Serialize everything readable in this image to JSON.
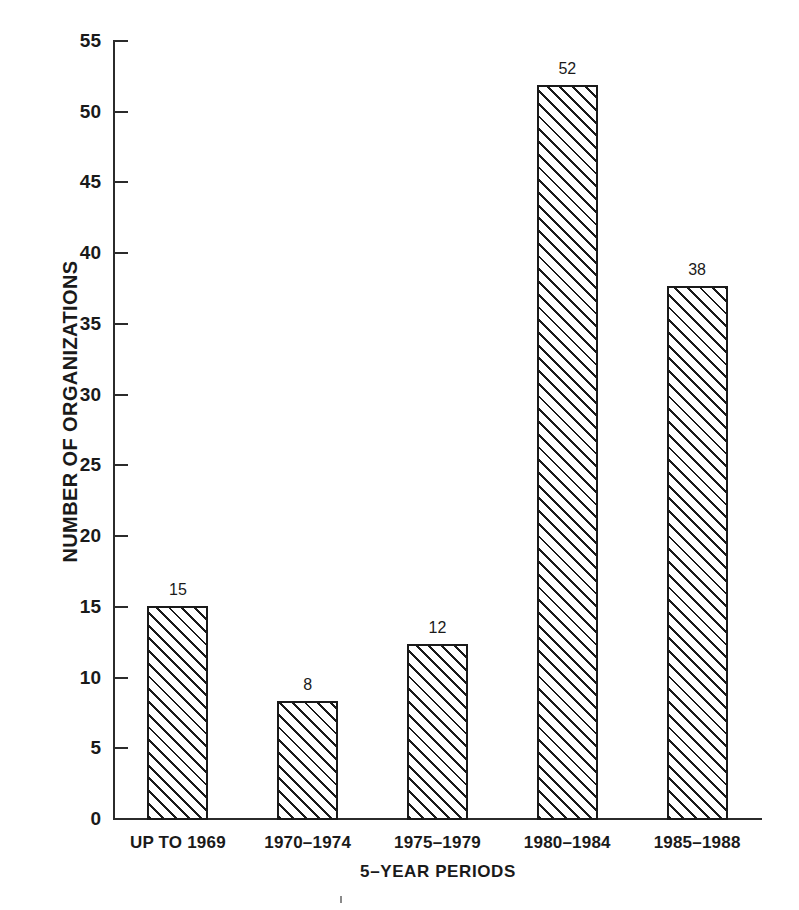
{
  "chart_data": {
    "type": "bar",
    "title": "",
    "subtitle": "",
    "xlabel": "5–YEAR PERIODS",
    "ylabel": "NUMBER OF ORGANIZATIONS",
    "categories": [
      "UP TO 1969",
      "1970–1974",
      "1975–1979",
      "1980–1984",
      "1985–1988"
    ],
    "values": [
      15,
      8,
      12,
      52,
      38
    ],
    "plotted_heights": [
      15.0,
      8.3,
      12.3,
      51.8,
      37.6
    ],
    "data_labels": [
      "15",
      "8",
      "12",
      "52",
      "38"
    ],
    "ylim": [
      0,
      55
    ],
    "ytick_step": 5,
    "yticks": [
      0,
      5,
      10,
      15,
      20,
      25,
      30,
      35,
      40,
      45,
      50,
      55
    ],
    "ytick_labels": [
      "0",
      "5",
      "10",
      "15",
      "20",
      "25",
      "30",
      "35",
      "40",
      "45",
      "50",
      "55"
    ],
    "grid": false,
    "legend": null,
    "legend_position": "none",
    "bar_fill": "diagonal-hatch",
    "bar_outline_color": "#1a1a1a",
    "axis_color": "#2b2b2b",
    "background_color": "#ffffff"
  }
}
